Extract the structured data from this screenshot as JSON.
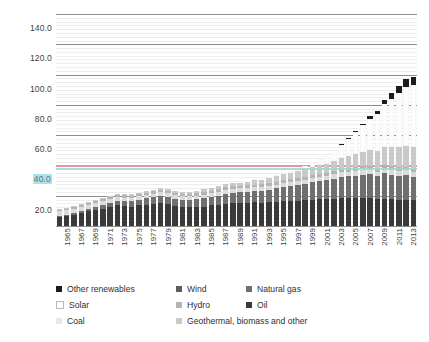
{
  "chart_data": {
    "type": "bar",
    "subtype": "stacked-bar",
    "title": "",
    "xlabel": "",
    "ylabel": "mtoe",
    "ylim": [
      0,
      140
    ],
    "ytick_step": 20,
    "minor_gridlines": true,
    "legend_position": "bottom",
    "ytick_labels": [
      "140.0",
      "120.0",
      "100.0",
      "80.0",
      "60.0",
      "40.0",
      "20.0"
    ],
    "ytick_values": [
      140,
      120,
      100,
      80,
      60,
      40,
      20
    ],
    "highlighted_ytick": "40.0",
    "annotation_line_value": 40,
    "annotation_line_color": "#e8929c",
    "teal_marker_value": 38,
    "teal_marker_color": "#9fd6d6",
    "x": [
      1965,
      1966,
      1967,
      1968,
      1969,
      1970,
      1971,
      1972,
      1973,
      1974,
      1975,
      1976,
      1977,
      1978,
      1979,
      1980,
      1981,
      1982,
      1983,
      1984,
      1985,
      1986,
      1987,
      1988,
      1989,
      1990,
      1991,
      1992,
      1993,
      1994,
      1995,
      1996,
      1997,
      1998,
      1999,
      2000,
      2001,
      2002,
      2003,
      2004,
      2005,
      2006,
      2007,
      2008,
      2009,
      2010,
      2011,
      2012,
      2013,
      2014
    ],
    "xtick_labels": [
      "1965",
      "1967",
      "1969",
      "1971",
      "1973",
      "1975",
      "1977",
      "1979",
      "1981",
      "1983",
      "1985",
      "1987",
      "1989",
      "1991",
      "1993",
      "1995",
      "1997",
      "1999",
      "2001",
      "2003",
      "2005",
      "2007",
      "2009",
      "2011",
      "2013"
    ],
    "series": [
      {
        "name": "Oil",
        "color": "#3a3a3a",
        "values": [
          6.0,
          6.8,
          7.6,
          8.6,
          9.6,
          10.6,
          11.4,
          12.4,
          13.6,
          13.2,
          12.8,
          13.6,
          14.2,
          14.8,
          15.2,
          14.4,
          13.4,
          12.8,
          12.6,
          12.6,
          12.8,
          13.6,
          14.0,
          14.6,
          15.0,
          15.2,
          15.2,
          15.6,
          15.4,
          15.6,
          15.8,
          16.2,
          16.6,
          16.8,
          17.2,
          17.4,
          17.6,
          17.6,
          17.8,
          18.2,
          18.2,
          18.2,
          18.4,
          18.2,
          17.6,
          17.8,
          17.6,
          17.2,
          17.0,
          17.0
        ]
      },
      {
        "name": "Natural gas",
        "color": "#6f6f6f",
        "values": [
          0.6,
          0.8,
          1.0,
          1.2,
          1.5,
          1.8,
          2.2,
          2.6,
          3.0,
          3.2,
          3.4,
          3.8,
          4.0,
          4.2,
          4.6,
          4.6,
          4.4,
          4.4,
          4.6,
          5.0,
          5.4,
          5.4,
          5.8,
          6.4,
          6.8,
          7.0,
          7.4,
          7.6,
          8.0,
          8.4,
          9.0,
          9.8,
          9.8,
          10.2,
          10.8,
          11.6,
          12.0,
          12.6,
          13.4,
          14.0,
          14.6,
          15.0,
          15.6,
          16.0,
          15.4,
          17.0,
          16.4,
          16.0,
          16.6,
          15.4
        ]
      },
      {
        "name": "Coal",
        "color": "#dcdcdc",
        "values": [
          3.0,
          3.0,
          2.8,
          2.8,
          2.8,
          2.8,
          2.6,
          2.6,
          2.6,
          2.4,
          2.4,
          2.4,
          2.4,
          2.4,
          2.6,
          2.6,
          2.6,
          2.4,
          2.4,
          2.4,
          2.6,
          2.6,
          2.8,
          2.8,
          2.8,
          2.6,
          2.4,
          2.4,
          2.4,
          2.4,
          2.4,
          2.6,
          2.6,
          2.6,
          2.6,
          2.8,
          2.8,
          2.8,
          3.0,
          3.2,
          3.2,
          3.4,
          3.4,
          3.2,
          3.0,
          3.2,
          3.2,
          3.4,
          3.4,
          3.2
        ]
      },
      {
        "name": "Hydro",
        "color": "#b4b4b4",
        "values": [
          1.0,
          1.1,
          1.2,
          1.2,
          1.3,
          1.3,
          1.4,
          1.4,
          1.4,
          1.5,
          1.5,
          1.4,
          1.5,
          1.6,
          1.6,
          1.6,
          1.6,
          1.6,
          1.7,
          1.7,
          1.7,
          1.8,
          1.8,
          1.8,
          1.7,
          1.7,
          1.8,
          1.8,
          1.9,
          1.9,
          2.0,
          2.0,
          2.0,
          2.0,
          2.0,
          2.1,
          2.0,
          2.0,
          2.0,
          2.1,
          2.1,
          2.1,
          2.1,
          2.2,
          2.2,
          2.3,
          2.2,
          2.2,
          2.3,
          2.3
        ]
      },
      {
        "name": "Geothermal, biomass and other",
        "color": "#c9c9c9",
        "values": [
          0.4,
          0.4,
          0.5,
          0.5,
          0.6,
          0.6,
          0.7,
          0.7,
          0.8,
          0.8,
          0.9,
          0.9,
          1.0,
          1.0,
          1.1,
          1.2,
          1.2,
          1.3,
          1.4,
          1.6,
          1.8,
          2.0,
          2.2,
          2.4,
          2.6,
          2.8,
          3.0,
          3.2,
          3.4,
          3.6,
          3.8,
          4.0,
          4.2,
          4.6,
          5.0,
          5.4,
          5.8,
          6.2,
          6.8,
          7.4,
          8.0,
          8.8,
          9.6,
          10.4,
          11.2,
          12.0,
          12.6,
          13.2,
          13.8,
          14.2
        ]
      },
      {
        "name": "Solar",
        "color": "#fdfdfd",
        "values": [
          0.0,
          0.0,
          0.0,
          0.0,
          0.0,
          0.0,
          0.0,
          0.0,
          0.0,
          0.0,
          0.0,
          0.0,
          0.0,
          0.0,
          0.0,
          0.0,
          0.0,
          0.0,
          0.0,
          0.0,
          0.0,
          0.0,
          0.0,
          0.0,
          0.1,
          0.1,
          0.1,
          0.2,
          0.2,
          0.3,
          0.4,
          0.6,
          0.9,
          1.4,
          2.0,
          2.8,
          3.8,
          5.0,
          6.6,
          8.8,
          11.6,
          14.6,
          17.4,
          20.6,
          24.4,
          28.0,
          32.0,
          36.0,
          39.0,
          41.0
        ]
      },
      {
        "name": "Wind",
        "color": "#5c5c5c",
        "values": [
          0.0,
          0.0,
          0.0,
          0.0,
          0.0,
          0.0,
          0.0,
          0.0,
          0.0,
          0.0,
          0.0,
          0.0,
          0.0,
          0.0,
          0.0,
          0.0,
          0.0,
          0.0,
          0.0,
          0.0,
          0.0,
          0.0,
          0.0,
          0.0,
          0.0,
          0.0,
          0.0,
          0.0,
          0.0,
          0.0,
          0.0,
          0.0,
          0.0,
          0.0,
          0.0,
          0.0,
          0.0,
          0.0,
          0.0,
          0.0,
          0.0,
          0.0,
          0.0,
          0.0,
          0.0,
          0.0,
          0.0,
          0.0,
          0.0,
          0.0
        ]
      },
      {
        "name": "Other renewables",
        "color": "#1b1b1b",
        "values": [
          0.0,
          0.0,
          0.0,
          0.0,
          0.0,
          0.0,
          0.0,
          0.0,
          0.0,
          0.0,
          0.0,
          0.0,
          0.0,
          0.0,
          0.0,
          0.0,
          0.0,
          0.0,
          0.0,
          0.0,
          0.0,
          0.0,
          0.0,
          0.0,
          0.0,
          0.0,
          0.0,
          0.0,
          0.0,
          0.0,
          0.0,
          0.0,
          0.0,
          0.0,
          0.0,
          0.0,
          0.0,
          0.0,
          0.0,
          0.2,
          0.4,
          0.8,
          1.2,
          1.8,
          2.4,
          3.2,
          3.8,
          4.4,
          5.0,
          5.4
        ]
      }
    ],
    "legend_entries": [
      {
        "label": "Other renewables",
        "color": "#1b1b1b",
        "outlined": false
      },
      {
        "label": "Wind",
        "color": "#5c5c5c",
        "outlined": false
      },
      {
        "label": "Natural gas",
        "color": "#6f6f6f",
        "outlined": false
      },
      {
        "label": "Solar",
        "color": "#ffffff",
        "outlined": true
      },
      {
        "label": "Hydro",
        "color": "#b4b4b4",
        "outlined": false
      },
      {
        "label": "Oil",
        "color": "#3a3a3a",
        "outlined": false
      },
      {
        "label": "Coal",
        "color": "#e8e8e8",
        "outlined": false
      },
      {
        "label": "Geothermal, biomass and other",
        "color": "#c9c9c9",
        "outlined": false
      }
    ]
  }
}
